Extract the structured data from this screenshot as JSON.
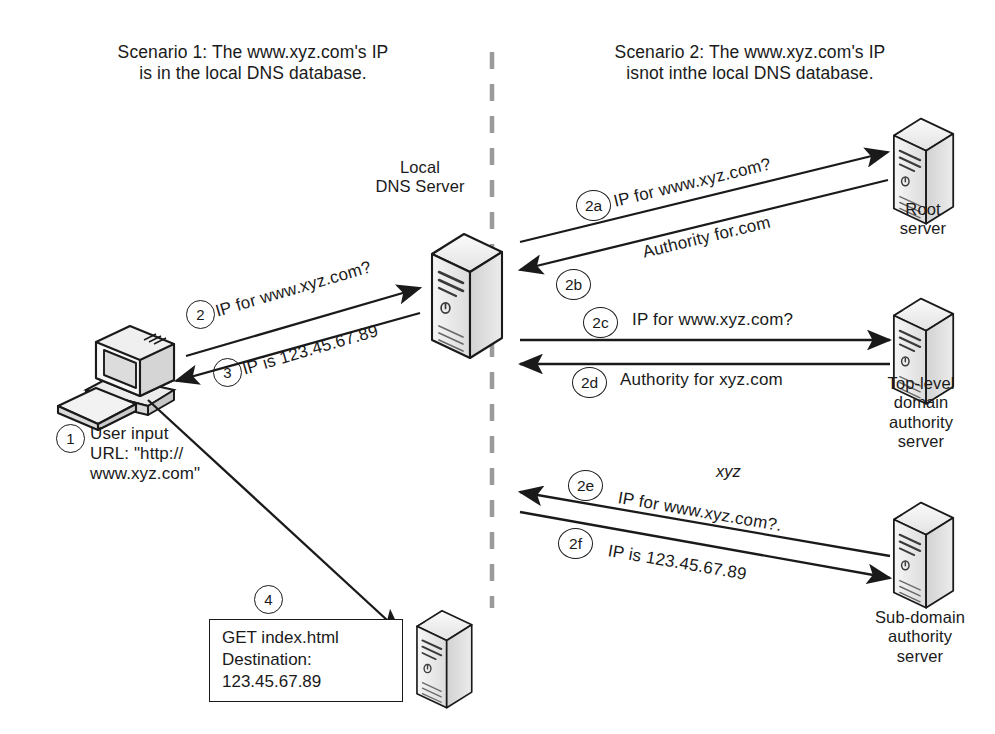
{
  "diagram": {
    "title_scenario1": "Scenario 1: The www.xyz.com's IP\nis in the local DNS database.",
    "title_scenario2": "Scenario 2: The www.xyz.com's IP\nisnot inthe local DNS database.",
    "divider": "vertical-dashed-divider"
  },
  "nodes": {
    "client": {
      "icon": "desktop-computer-icon",
      "label": ""
    },
    "local_dns": {
      "icon": "server-tower-icon",
      "label": "Local\nDNS Server"
    },
    "root": {
      "icon": "server-tower-icon",
      "label": "Root\nserver"
    },
    "tld": {
      "icon": "server-tower-icon",
      "label": "Top-level\ndomain\nauthority\nserver"
    },
    "subdomain": {
      "icon": "server-tower-icon",
      "label": "Sub-domain\nauthority\nserver"
    },
    "web_server": {
      "icon": "server-tower-icon",
      "label": ""
    }
  },
  "steps": {
    "s1": {
      "badge": "1",
      "text": "User input\nURL: \"http://\nwww.xyz.com\""
    },
    "s2": {
      "badge": "2",
      "text": "IP for www.xyz.com?"
    },
    "s3": {
      "badge": "3",
      "text": "IP is 123.45.67.89"
    },
    "s4": {
      "badge": "4",
      "text": "GET index.html\nDestination:\n123.45.67.89"
    },
    "s2a": {
      "badge": "2a",
      "text": "IP for www.xyz.com?"
    },
    "s2b": {
      "badge": "2b",
      "text": "Authority for.com"
    },
    "s2c": {
      "badge": "2c",
      "text": "IP for www.xyz.com?"
    },
    "s2d": {
      "badge": "2d",
      "text": "Authority for xyz.com"
    },
    "s2e": {
      "badge": "2e",
      "text": "IP for www.xyz.com?."
    },
    "s2f": {
      "badge": "2f",
      "text": "IP is 123.45.67.89"
    },
    "annotation_xyz": {
      "text": "xyz"
    }
  },
  "colors": {
    "ink": "#1a1a1a",
    "paper": "#ffffff",
    "icon_fill": "#ededed",
    "icon_shade": "#c9c9c9"
  }
}
